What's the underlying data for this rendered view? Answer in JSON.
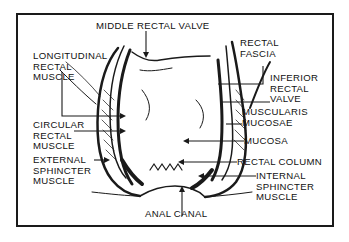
{
  "diagram": {
    "labels": {
      "middle_rectal_valve": "MIDDLE RECTAL VALVE",
      "longitudinal_rectal_muscle": "LONGITUDINAL\nRECTAL\nMUSCLE",
      "rectal_fascia": "RECTAL\nFASCIA",
      "inferior_rectal_valve": "INFERIOR\nRECTAL\nVALVE",
      "muscularis_mucosae": "MUSCULARIS\nMUCOSAE",
      "circular_rectal_muscle": "CIRCULAR\nRECTAL\nMUSCLE",
      "mucosa": "MUCOSA",
      "external_sphincter_muscle": "EXTERNAL\nSPHINCTER\nMUSCLE",
      "rectal_column": "RECTAL COLUMN",
      "internal_sphincter_muscle": "INTERNAL\nSPHINCTER\nMUSCLE",
      "anal_canal": "ANAL CANAL"
    },
    "colors": {
      "ink": "#1a1a1a",
      "paper": "#ffffff"
    }
  }
}
